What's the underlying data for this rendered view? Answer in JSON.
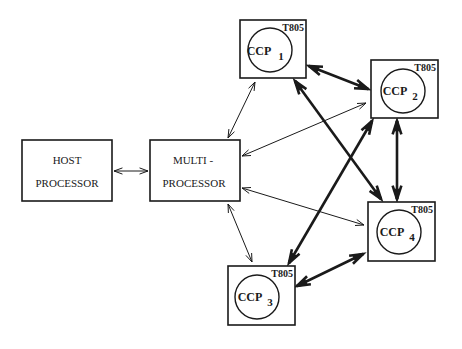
{
  "host": {
    "line1": "HOST",
    "line2": "PROCESSOR"
  },
  "multi": {
    "line1": "MULTI -",
    "line2": "PROCESSOR"
  },
  "nodes": [
    {
      "id": "ccp1",
      "label": "CCP",
      "index": "1",
      "chip": "T805"
    },
    {
      "id": "ccp2",
      "label": "CCP",
      "index": "2",
      "chip": "T805"
    },
    {
      "id": "ccp3",
      "label": "CCP",
      "index": "3",
      "chip": "T805"
    },
    {
      "id": "ccp4",
      "label": "CCP",
      "index": "4",
      "chip": "T805"
    }
  ],
  "connections": [
    {
      "from": "host",
      "to": "multi",
      "type": "bidirectional",
      "weight": "thin"
    },
    {
      "from": "multi",
      "to": "ccp1",
      "type": "bidirectional",
      "weight": "thin"
    },
    {
      "from": "multi",
      "to": "ccp2",
      "type": "bidirectional",
      "weight": "thin"
    },
    {
      "from": "multi",
      "to": "ccp3",
      "type": "bidirectional",
      "weight": "thin"
    },
    {
      "from": "multi",
      "to": "ccp4",
      "type": "bidirectional",
      "weight": "thin"
    },
    {
      "from": "ccp1",
      "to": "ccp2",
      "type": "bidirectional",
      "weight": "thick"
    },
    {
      "from": "ccp1",
      "to": "ccp4",
      "type": "bidirectional",
      "weight": "thick"
    },
    {
      "from": "ccp2",
      "to": "ccp3",
      "type": "bidirectional",
      "weight": "thick"
    },
    {
      "from": "ccp2",
      "to": "ccp4",
      "type": "bidirectional",
      "weight": "thick"
    },
    {
      "from": "ccp3",
      "to": "ccp4",
      "type": "bidirectional",
      "weight": "thick"
    }
  ]
}
